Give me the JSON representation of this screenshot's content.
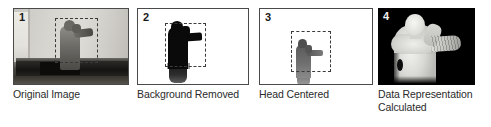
{
  "figure": {
    "background_color": "#ffffff",
    "panels": [
      {
        "number": "1",
        "caption": "Original Image",
        "description": "grayscale photo of a person standing in front of a wall with a bed in the foreground",
        "has_border": true,
        "has_dashed_box": true,
        "dashed_box_label": "head-and-torso region of interest",
        "number_color": "#1a1a1a",
        "background_color": "#d6d4cf"
      },
      {
        "number": "2",
        "caption": "Background Removed",
        "description": "black silhouette of the person on a white background",
        "has_border": true,
        "has_dashed_box": true,
        "dashed_box_label": "head-and-torso region of interest",
        "number_color": "#1a1a1a",
        "background_color": "#ffffff"
      },
      {
        "number": "3",
        "caption": "Head Centered",
        "description": "gray figure re-positioned so the head is centered within the dashed box",
        "has_border": true,
        "has_dashed_box": true,
        "dashed_box_label": "head-centered crop window",
        "number_color": "#1a1a1a",
        "background_color": "#ffffff"
      },
      {
        "number": "4",
        "caption": "Data Representation\nCalculated",
        "description": "depth map of the person rendered in light gray on a black background",
        "has_border": false,
        "has_dashed_box": false,
        "dashed_box_label": "",
        "number_color": "#f2f2f2",
        "background_color": "#000000"
      }
    ]
  }
}
